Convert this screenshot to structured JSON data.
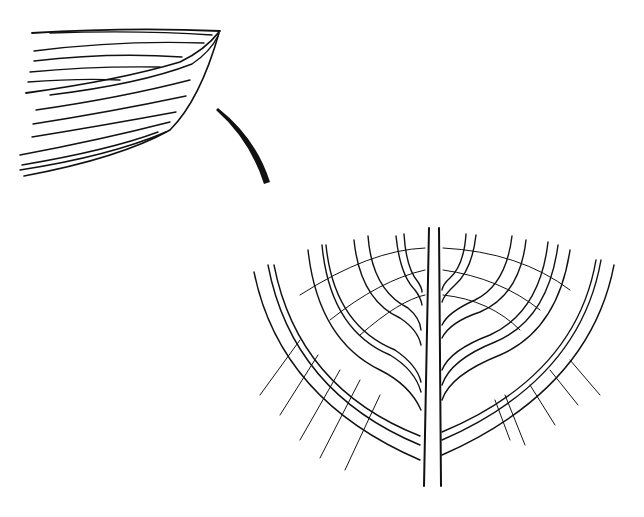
{
  "figure": {
    "type": "line-drawing",
    "parts": [
      {
        "id": "hull-side-view",
        "description": "bow of a clinker hull, planking lines converging at stem"
      },
      {
        "id": "stem-piece",
        "description": "single curved tapered stem timber"
      },
      {
        "id": "body-plan",
        "description": "symmetric frame sections branching from central keel"
      }
    ],
    "colors": {
      "ink": "#111111",
      "paper": "#ffffff"
    }
  }
}
